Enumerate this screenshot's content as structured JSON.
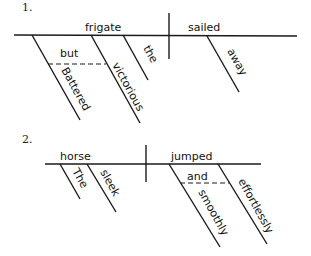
{
  "diagrams": [
    {
      "number": "1.",
      "subject": "frigate",
      "verb": "sailed",
      "subject_modifiers": [
        "Battered",
        "victorious",
        "the"
      ],
      "conjunction": "but",
      "verb_modifiers": [
        "away"
      ]
    },
    {
      "number": "2.",
      "subject": "horse",
      "verb": "jumped",
      "subject_modifiers": [
        "The",
        "sleek"
      ],
      "conjunction": "and",
      "verb_modifiers": [
        "smoothly",
        "effortlessly"
      ]
    }
  ]
}
